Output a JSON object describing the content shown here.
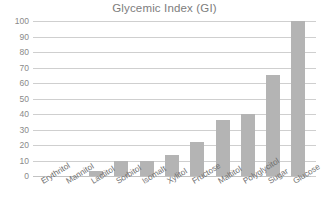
{
  "chart_data": {
    "type": "bar",
    "title": "Glycemic Index (GI)",
    "xlabel": "",
    "ylabel": "",
    "ylim": [
      0,
      100
    ],
    "yticks": [
      0,
      10,
      20,
      30,
      40,
      50,
      60,
      70,
      80,
      90,
      100
    ],
    "ytick_labels": [
      "0",
      "10",
      "20",
      "30",
      "40",
      "50",
      "60",
      "70",
      "80",
      "90",
      "100"
    ],
    "grid": true,
    "legend": false,
    "bar_color": "#b4b4b4",
    "categories": [
      "Erythritol",
      "Mannitol",
      "Lactitol",
      "Sorbitol",
      "Isomalt",
      "Xylitol",
      "Fructose",
      "Maltitol",
      "Polyglycitol",
      "Sugar",
      "Glucose"
    ],
    "values": [
      0,
      0,
      3.5,
      9.5,
      9.5,
      13.5,
      22,
      36,
      40,
      65,
      100
    ]
  },
  "colors": {
    "background": "#ffffff",
    "title_text": "#7d7d7d",
    "tick_text": "#8a8a8a",
    "category_text": "#6f6f6f",
    "gridline": "#cfcfcf",
    "bar": "#b4b4b4"
  }
}
